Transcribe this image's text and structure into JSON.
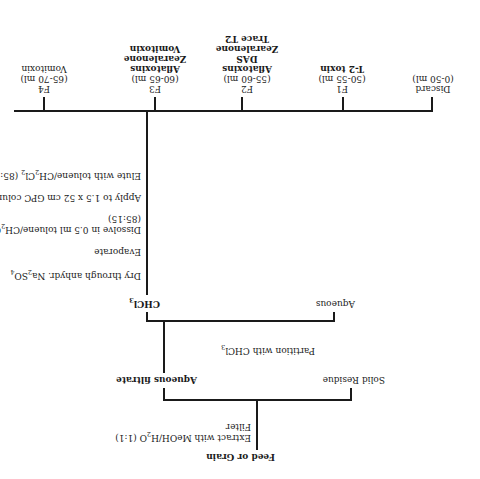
{
  "diagram": {
    "type": "flowchart",
    "orientation_note": "rendered rotated 180 degrees",
    "root": {
      "label": "Feed or Grain"
    },
    "step1": {
      "line1": "Extract with MeOH/H",
      "sub1": "2",
      "line1_end": "O (1:1)",
      "line2": "Filter"
    },
    "branch1": {
      "left": "Solid Residue",
      "right": "Aqueous filtrate"
    },
    "step2": {
      "text": "Partition with CHCl",
      "sub": "3"
    },
    "branch2": {
      "left": "Aqueous",
      "right_text": "CHCl",
      "right_sub": "3"
    },
    "steps": [
      {
        "text": "Dry through anhydr. Na",
        "sub1": "2",
        "mid": "SO",
        "sub2": "4"
      },
      {
        "text": "Evaporate"
      },
      {
        "text": "Dissolve in 0.5 ml toluene/CH",
        "sub1": "2",
        "mid": "Cl",
        "sub2": "2",
        "line2": "(85:15)"
      },
      {
        "text": "Apply to 1.5 x 52 cm GPC column"
      },
      {
        "text": "Elute with toluene/CH",
        "sub1": "2",
        "mid": "Cl",
        "sub2": "2",
        "end": " (85:15)"
      }
    ],
    "fractions": [
      {
        "name": "Discard",
        "range": "(0-50 ml)",
        "contents": []
      },
      {
        "name": "F1",
        "range": "(50-55 ml)",
        "contents": [
          "T-2 toxin"
        ]
      },
      {
        "name": "F2",
        "range": "(55-60 ml)",
        "contents": [
          "Aflatoxins",
          "DAS",
          "Zearalenone",
          "Trace T2"
        ]
      },
      {
        "name": "F3",
        "range": "(60-65 ml)",
        "contents": [
          "Aflatoxins",
          "Zearalenone",
          "Vomitoxin"
        ]
      },
      {
        "name": "F4",
        "range": "(65-70 ml)",
        "contents": [
          "Vomitoxin"
        ]
      }
    ]
  }
}
